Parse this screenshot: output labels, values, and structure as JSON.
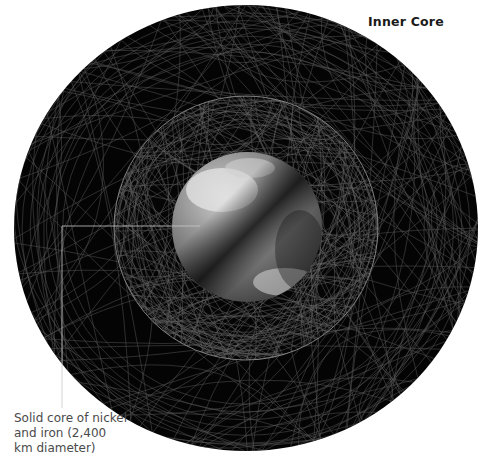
{
  "diagram": {
    "title": "Inner Core",
    "caption_lines": [
      "Solid core of nickel",
      "and iron (2,400",
      "km diameter)"
    ],
    "colors": {
      "background": "#ffffff",
      "sphere": "#050505",
      "wire": "#bfbfbf",
      "leader": "#c8c8c8",
      "core_light": "#d9d9d9",
      "core_dark": "#2a2a2a"
    }
  }
}
